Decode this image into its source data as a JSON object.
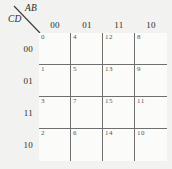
{
  "figure": {
    "type": "karnaugh-map",
    "variables_columns_label": "AB",
    "variables_rows_label": "CD"
  },
  "headers": {
    "columns": [
      "00",
      "01",
      "11",
      "10"
    ],
    "rows": [
      "00",
      "01",
      "11",
      "10"
    ]
  },
  "cells": [
    [
      {
        "index": "0",
        "value": ""
      },
      {
        "index": "4",
        "value": ""
      },
      {
        "index": "12",
        "value": ""
      },
      {
        "index": "8",
        "value": ""
      }
    ],
    [
      {
        "index": "1",
        "value": ""
      },
      {
        "index": "5",
        "value": ""
      },
      {
        "index": "13",
        "value": ""
      },
      {
        "index": "9",
        "value": ""
      }
    ],
    [
      {
        "index": "3",
        "value": ""
      },
      {
        "index": "7",
        "value": ""
      },
      {
        "index": "15",
        "value": ""
      },
      {
        "index": "11",
        "value": ""
      }
    ],
    [
      {
        "index": "2",
        "value": ""
      },
      {
        "index": "6",
        "value": ""
      },
      {
        "index": "14",
        "value": ""
      },
      {
        "index": "10",
        "value": ""
      }
    ]
  ],
  "colors": {
    "background": "#f2f2f0",
    "grid_outer": "#2a2a2a",
    "grid_inner": "#6f6f6f",
    "text": "#2b2b2b",
    "index_text": "#555555"
  }
}
